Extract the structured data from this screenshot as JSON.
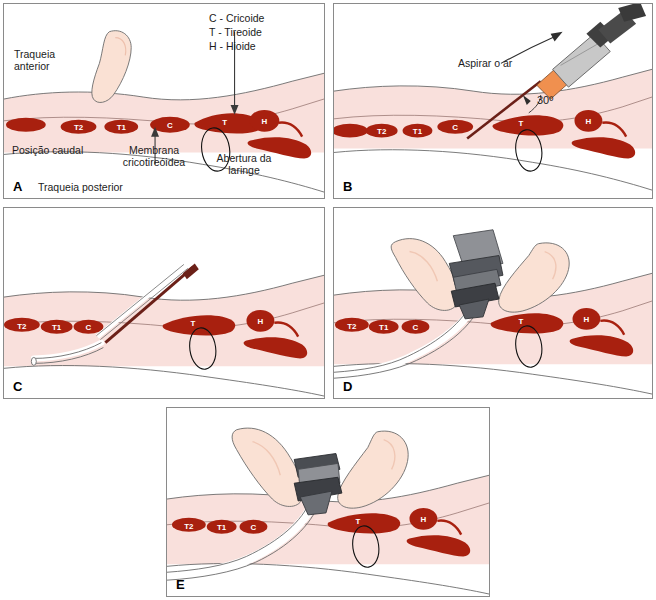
{
  "figure": {
    "panel_count": 5
  },
  "colors": {
    "cartilage": "#a8200f",
    "cartilage_dark": "#8d1a0c",
    "skin": "#f9e0dc",
    "skin_hand": "#fae1d4",
    "skin_hand_shadow": "#f0c7b4",
    "outline": "#6b6b6b",
    "syringe_hub": "#f0904f",
    "syringe_barrel": "#b9b9b9",
    "syringe_plunger": "#4a4a4a",
    "needle": "#6b2018",
    "device_gray": "#8f9196",
    "device_dark": "#3d3f44",
    "tube_white": "#ffffff",
    "panel_border": "#8a8a8a",
    "background": "#ffffff",
    "text": "#1c1c1c"
  },
  "legend": {
    "name": "anatomy-abbreviations",
    "lines": [
      "C - Cricoide",
      "T - Tireoide",
      "H - Hioide"
    ],
    "text": "C - Cricoide\nT - Tireoide\nH - Hioide"
  },
  "ring_labels": {
    "t2": "T2",
    "t1": "T1",
    "c": "C",
    "t": "T",
    "h": "H"
  },
  "panels": [
    {
      "id": "A",
      "letter": "A",
      "name": "panel-a-landmark-identification",
      "labels": {
        "trachea_anterior": "Traqueia\nanterior",
        "caudal_position": "Posição caudal",
        "cricothyroid_membrane": "Membrana\ncricotireóidea",
        "laryngeal_opening": "Abertura da\nlaringe",
        "trachea_posterior": "Traqueia posterior"
      }
    },
    {
      "id": "B",
      "letter": "B",
      "name": "panel-b-needle-aspiration",
      "labels": {
        "aspirate_air": "Aspirar o ar",
        "angle": "30º"
      }
    },
    {
      "id": "C",
      "letter": "C",
      "name": "panel-c-guidewire-dilator",
      "labels": {}
    },
    {
      "id": "D",
      "letter": "D",
      "name": "panel-d-cannula-insertion",
      "labels": {}
    },
    {
      "id": "E",
      "letter": "E",
      "name": "panel-e-cannula-in-place",
      "labels": {}
    }
  ]
}
